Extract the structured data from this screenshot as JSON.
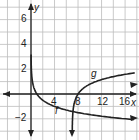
{
  "chart_data": {
    "type": "line",
    "title": "",
    "xlabel": "x",
    "ylabel": "y",
    "x_ticks": [
      "4",
      "8",
      "12",
      "16"
    ],
    "y_ticks": [
      "6",
      "4",
      "2",
      "-2"
    ],
    "xlim": [
      -4,
      18
    ],
    "ylim": [
      -3.5,
      7
    ],
    "grid": true,
    "series": [
      {
        "name": "f",
        "label": "f",
        "function": "log_(1/4)(x)",
        "asymptote_x": 0,
        "points": [
          [
            0.05,
            2.16
          ],
          [
            0.25,
            1
          ],
          [
            1,
            0
          ],
          [
            4,
            -1
          ],
          [
            16,
            -2
          ],
          [
            18,
            -2.08
          ]
        ]
      },
      {
        "name": "g",
        "label": "g",
        "function": "log_4(x - 7)",
        "asymptote_x": 7,
        "points": [
          [
            7.05,
            -2.16
          ],
          [
            7.25,
            -1
          ],
          [
            8,
            0
          ],
          [
            11,
            1
          ],
          [
            18,
            1.73
          ]
        ]
      }
    ]
  },
  "labels": {
    "x_axis": "x",
    "y_axis": "y",
    "f": "f",
    "g": "g",
    "t4": "4",
    "t8": "8",
    "t12": "12",
    "t16": "16",
    "y6": "6",
    "y4": "4",
    "y2": "2",
    "yn2": "−2"
  }
}
